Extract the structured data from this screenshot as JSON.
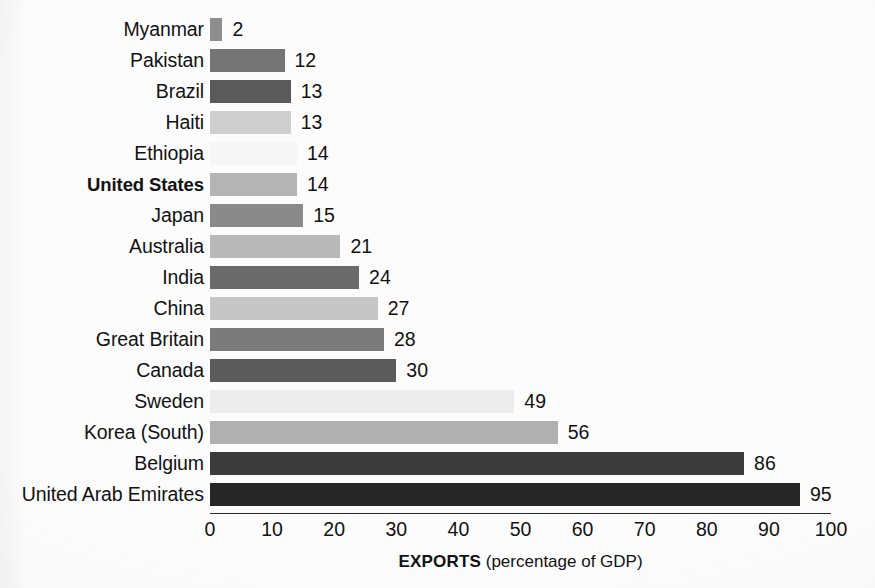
{
  "chart_data": {
    "type": "bar",
    "orientation": "horizontal",
    "title": "",
    "subtitle": "",
    "xlabel_bold": "EXPORTS",
    "xlabel_rest": " (percentage of GDP)",
    "xlabel": "EXPORTS (percentage of GDP)",
    "ylabel": "",
    "xlim": [
      0,
      100
    ],
    "xticks": [
      0,
      10,
      20,
      30,
      40,
      50,
      60,
      70,
      80,
      90,
      100
    ],
    "xtick_labels": [
      "0",
      "10",
      "20",
      "30",
      "40",
      "50",
      "60",
      "70",
      "80",
      "90",
      "100"
    ],
    "grid": false,
    "legend": false,
    "legend_position": "none",
    "value_labels_shown": true,
    "categories": [
      "Myanmar",
      "Pakistan",
      "Brazil",
      "Haiti",
      "Ethiopia",
      "United States",
      "Japan",
      "Australia",
      "India",
      "China",
      "Great Britain",
      "Canada",
      "Sweden",
      "Korea (South)",
      "Belgium",
      "United Arab Emirates"
    ],
    "values": [
      2,
      12,
      13,
      13,
      14,
      14,
      15,
      21,
      24,
      27,
      28,
      30,
      49,
      56,
      86,
      95
    ],
    "bar_colors": [
      "#8e8e8e",
      "#757575",
      "#5a5a5a",
      "#cfcfcf",
      "#f6f6f6",
      "#b4b4b4",
      "#8a8a8a",
      "#b9b9b9",
      "#6a6a6a",
      "#c6c6c6",
      "#7b7b7b",
      "#5b5b5b",
      "#ececec",
      "#b0b0b0",
      "#3b3b3b",
      "#262626"
    ],
    "highlighted_category": "United States"
  },
  "rows": [
    {
      "label": "Myanmar",
      "value": 2,
      "value_text": "2",
      "color": "#8e8e8e",
      "bold": false
    },
    {
      "label": "Pakistan",
      "value": 12,
      "value_text": "12",
      "color": "#757575",
      "bold": false
    },
    {
      "label": "Brazil",
      "value": 13,
      "value_text": "13",
      "color": "#5a5a5a",
      "bold": false
    },
    {
      "label": "Haiti",
      "value": 13,
      "value_text": "13",
      "color": "#cfcfcf",
      "bold": false
    },
    {
      "label": "Ethiopia",
      "value": 14,
      "value_text": "14",
      "color": "#f6f6f6",
      "bold": false
    },
    {
      "label": "United States",
      "value": 14,
      "value_text": "14",
      "color": "#b4b4b4",
      "bold": true
    },
    {
      "label": "Japan",
      "value": 15,
      "value_text": "15",
      "color": "#8a8a8a",
      "bold": false
    },
    {
      "label": "Australia",
      "value": 21,
      "value_text": "21",
      "color": "#b9b9b9",
      "bold": false
    },
    {
      "label": "India",
      "value": 24,
      "value_text": "24",
      "color": "#6a6a6a",
      "bold": false
    },
    {
      "label": "China",
      "value": 27,
      "value_text": "27",
      "color": "#c6c6c6",
      "bold": false
    },
    {
      "label": "Great Britain",
      "value": 28,
      "value_text": "28",
      "color": "#7b7b7b",
      "bold": false
    },
    {
      "label": "Canada",
      "value": 30,
      "value_text": "30",
      "color": "#5b5b5b",
      "bold": false
    },
    {
      "label": "Sweden",
      "value": 49,
      "value_text": "49",
      "color": "#ececec",
      "bold": false
    },
    {
      "label": "Korea (South)",
      "value": 56,
      "value_text": "56",
      "color": "#b0b0b0",
      "bold": false
    },
    {
      "label": "Belgium",
      "value": 86,
      "value_text": "86",
      "color": "#3b3b3b",
      "bold": false
    },
    {
      "label": "United Arab Emirates",
      "value": 95,
      "value_text": "95",
      "color": "#262626",
      "bold": false
    }
  ],
  "axis": {
    "tick_labels": [
      "0",
      "10",
      "20",
      "30",
      "40",
      "50",
      "60",
      "70",
      "80",
      "90",
      "100"
    ],
    "title_bold": "EXPORTS",
    "title_rest": " (percentage of GDP)"
  },
  "layout": {
    "origin_x": 210,
    "px_per_unit": 6.21,
    "row_pitch": 31,
    "first_row_top": 14,
    "axis_y": 513
  }
}
